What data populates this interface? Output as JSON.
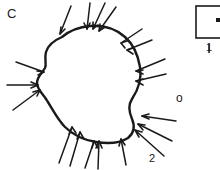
{
  "figure": {
    "type": "line-drawing",
    "canvas": {
      "width": 220,
      "height": 170,
      "background": "#ffffff"
    },
    "stroke_color": "#1a1a1a",
    "labels": {
      "panel": "C",
      "region_marker": "o",
      "annotation_two": "2",
      "inset_caption": "1"
    },
    "inset_box": {
      "present": true,
      "clipped_at_right_edge": true,
      "marker": "dot"
    },
    "arrow_count": 17,
    "outline_points": "M 62 37 L 72 31 L 86 27 L 100 26 L 113 29 L 124 35 L 132 44 L 137 55 L 140 66 L 141 76 L 139 86 L 134 96 L 130 104 L 131 112 L 134 120 L 133 129 L 127 136 L 118 141 L 107 143 L 95 142 L 84 139 L 74 135 L 66 129 L 60 121 L 55 112 L 50 103 L 45 96 L 40 91 L 37 85 L 38 78 L 42 72 L 45 66 L 44 59 L 47 50 L 54 42 Z",
    "arrows": [
      {
        "id": "arrow-top-1",
        "x1": 71,
        "y1": 6,
        "x2": 59,
        "y2": 35
      },
      {
        "id": "arrow-top-2",
        "x1": 90,
        "y1": 3,
        "x2": 87,
        "y2": 30
      },
      {
        "id": "arrow-top-3",
        "x1": 104,
        "y1": 3,
        "x2": 92,
        "y2": 29
      },
      {
        "id": "arrow-top-4",
        "x1": 114,
        "y1": 6,
        "x2": 97,
        "y2": 30
      },
      {
        "id": "arrow-ur-1",
        "x1": 141,
        "y1": 30,
        "x2": 121,
        "y2": 43
      },
      {
        "id": "arrow-ur-2",
        "x1": 150,
        "y1": 41,
        "x2": 126,
        "y2": 50
      },
      {
        "id": "arrow-right-1",
        "x1": 163,
        "y1": 60,
        "x2": 135,
        "y2": 71
      },
      {
        "id": "arrow-right-2",
        "x1": 164,
        "y1": 75,
        "x2": 135,
        "y2": 81
      },
      {
        "id": "arrow-left-1",
        "x1": 17,
        "y1": 63,
        "x2": 43,
        "y2": 72
      },
      {
        "id": "arrow-left-2",
        "x1": 8,
        "y1": 86,
        "x2": 37,
        "y2": 86
      },
      {
        "id": "arrow-left-3",
        "x1": 14,
        "y1": 109,
        "x2": 39,
        "y2": 90
      },
      {
        "id": "arrow-bl-1",
        "x1": 60,
        "y1": 163,
        "x2": 72,
        "y2": 128
      },
      {
        "id": "arrow-bl-2",
        "x1": 70,
        "y1": 164,
        "x2": 79,
        "y2": 132
      },
      {
        "id": "arrow-bottom-1",
        "x1": 85,
        "y1": 167,
        "x2": 94,
        "y2": 142
      },
      {
        "id": "arrow-bottom-2",
        "x1": 97,
        "y1": 168,
        "x2": 98,
        "y2": 142
      },
      {
        "id": "arrow-bottom-3",
        "x1": 124,
        "y1": 164,
        "x2": 120,
        "y2": 140
      },
      {
        "id": "arrow-lr-1",
        "x1": 174,
        "y1": 122,
        "x2": 141,
        "y2": 116
      },
      {
        "id": "arrow-lr-2",
        "x1": 170,
        "y1": 140,
        "x2": 137,
        "y2": 124
      },
      {
        "id": "arrow-lr-3",
        "x1": 163,
        "y1": 154,
        "x2": 134,
        "y2": 130
      }
    ]
  }
}
